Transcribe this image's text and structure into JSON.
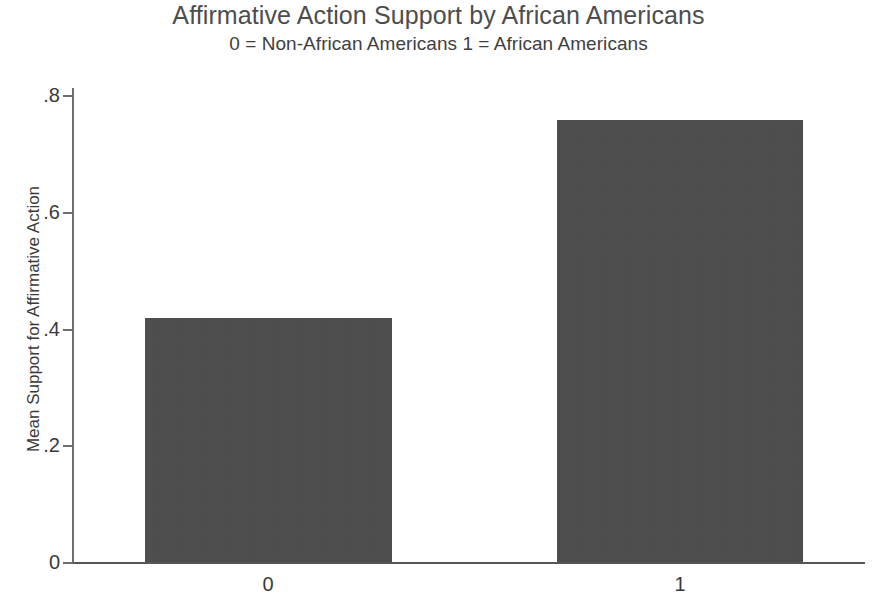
{
  "chart_data": {
    "type": "bar",
    "title": "Affirmative Action Support by African Americans",
    "subtitle": "0 = Non-African Americans 1 = African Americans",
    "xlabel": "",
    "ylabel": "Mean Support for Affirmative Action",
    "categories": [
      "0",
      "1"
    ],
    "values": [
      0.418,
      0.757
    ],
    "ylim": [
      0,
      0.8
    ],
    "yticks": [
      0,
      0.2,
      0.4,
      0.6,
      0.8
    ],
    "ytick_labels": [
      "0",
      ".2",
      ".4",
      ".6",
      ".8"
    ],
    "grid": false,
    "legend": false,
    "bar_color": "#4b4b4b",
    "axis_color": "#6e6e6e",
    "background_color": "#ffffff"
  }
}
